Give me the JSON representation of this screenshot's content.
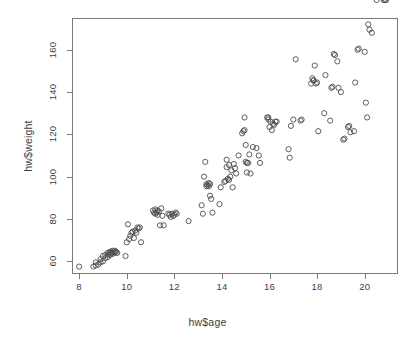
{
  "chart_data": {
    "type": "scatter",
    "title": "",
    "xlabel": "hw$age",
    "ylabel": "hw$weight",
    "xlim": [
      7.7,
      21.4
    ],
    "ylim": [
      54,
      175
    ],
    "grid": false,
    "legend": "none",
    "point_symbol": "open-circle",
    "point_color": "#4d4d4d",
    "xticks": [
      8,
      10,
      12,
      14,
      16,
      18,
      20
    ],
    "yticks": [
      60,
      80,
      100,
      120,
      140,
      160
    ],
    "n_points": 151,
    "x": [
      8.0,
      8.6,
      8.7,
      8.7,
      8.8,
      8.9,
      8.9,
      9.0,
      9.0,
      9.1,
      9.1,
      9.2,
      9.2,
      9.25,
      9.3,
      9.3,
      9.35,
      9.4,
      9.4,
      9.45,
      9.5,
      9.5,
      9.55,
      9.6,
      9.95,
      10.0,
      10.05,
      10.1,
      10.15,
      10.2,
      10.25,
      10.3,
      10.35,
      10.4,
      10.45,
      10.5,
      10.55,
      10.6,
      11.1,
      11.15,
      11.2,
      11.2,
      11.25,
      11.3,
      11.3,
      11.35,
      11.4,
      11.45,
      11.5,
      11.55,
      11.75,
      11.8,
      11.85,
      11.9,
      11.95,
      12.0,
      12.05,
      12.1,
      12.6,
      13.15,
      13.2,
      13.25,
      13.3,
      13.35,
      13.35,
      13.4,
      13.45,
      13.45,
      13.5,
      13.5,
      13.55,
      13.6,
      13.9,
      13.95,
      14.1,
      14.15,
      14.2,
      14.2,
      14.25,
      14.3,
      14.3,
      14.35,
      14.4,
      14.45,
      14.5,
      14.55,
      14.6,
      14.7,
      14.85,
      14.9,
      14.95,
      14.95,
      15.0,
      15.0,
      15.05,
      15.05,
      15.1,
      15.15,
      15.2,
      15.3,
      15.45,
      15.55,
      15.6,
      15.9,
      15.95,
      15.95,
      16.0,
      16.05,
      16.1,
      16.15,
      16.2,
      16.25,
      16.3,
      16.8,
      16.85,
      16.9,
      17.0,
      17.1,
      17.3,
      17.35,
      17.75,
      17.8,
      17.85,
      17.85,
      17.9,
      17.95,
      18.0,
      18.05,
      18.3,
      18.35,
      18.55,
      18.6,
      18.65,
      18.7,
      18.75,
      18.85,
      18.9,
      19.0,
      19.1,
      19.15,
      19.3,
      19.35,
      19.4,
      19.55,
      19.6,
      19.7,
      19.75,
      20.0,
      20.05,
      20.1,
      20.15,
      20.2,
      20.3,
      20.5,
      20.8,
      20.85,
      20.9
    ],
    "y": [
      57.5,
      57.5,
      58.0,
      59.5,
      58.5,
      59.5,
      61.0,
      60.0,
      62.5,
      61.5,
      63.0,
      62.0,
      64.0,
      63.5,
      63.0,
      64.5,
      64.0,
      63.5,
      65.0,
      64.5,
      64.0,
      65.0,
      64.5,
      64.0,
      62.5,
      69.0,
      77.5,
      70.5,
      72.0,
      73.5,
      74.0,
      71.0,
      74.5,
      73.5,
      76.0,
      75.5,
      76.0,
      69.0,
      84.0,
      83.0,
      84.5,
      82.5,
      83.0,
      84.0,
      82.0,
      83.5,
      77.0,
      85.0,
      81.5,
      77.0,
      82.5,
      82.0,
      81.0,
      82.5,
      81.5,
      82.0,
      83.0,
      82.5,
      79.0,
      86.5,
      82.5,
      100.0,
      107.0,
      96.5,
      95.5,
      96.0,
      97.0,
      95.5,
      96.5,
      91.0,
      89.5,
      83.0,
      87.0,
      95.0,
      97.5,
      98.0,
      104.5,
      108.0,
      99.0,
      98.5,
      105.5,
      100.0,
      103.0,
      95.0,
      106.0,
      104.0,
      101.5,
      110.0,
      120.5,
      121.5,
      122.0,
      128.0,
      107.0,
      115.0,
      106.5,
      102.0,
      106.5,
      110.5,
      101.5,
      114.0,
      113.5,
      110.0,
      106.5,
      128.0,
      127.0,
      128.0,
      123.5,
      126.0,
      122.0,
      125.0,
      124.5,
      126.0,
      126.0,
      113.0,
      109.0,
      124.0,
      127.0,
      155.5,
      126.5,
      127.0,
      144.0,
      146.5,
      145.5,
      145.5,
      152.5,
      144.0,
      144.5,
      121.5,
      130.0,
      148.0,
      126.5,
      142.0,
      142.5,
      158.0,
      157.5,
      154.5,
      142.0,
      140.0,
      117.5,
      118.0,
      123.5,
      124.0,
      121.0,
      121.5,
      144.5,
      160.0,
      160.5,
      159.0,
      135.0,
      128.0,
      172.0,
      169.5,
      168.0
    ]
  },
  "axis": {
    "x_title": "hw$age",
    "y_title": "hw$weight",
    "x_tick_labels": [
      "8",
      "10",
      "12",
      "14",
      "16",
      "18",
      "20"
    ],
    "y_tick_labels": [
      "60",
      "80",
      "100",
      "120",
      "140",
      "160"
    ]
  }
}
